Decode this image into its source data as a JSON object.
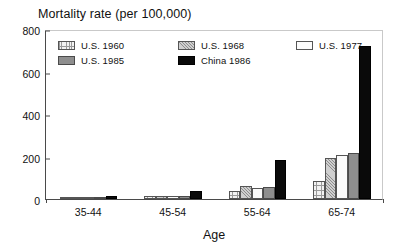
{
  "chart_data": {
    "type": "bar",
    "title": "Mortality rate (per 100,000)",
    "xlabel": "Age",
    "ylabel": "",
    "ylim": [
      0,
      800
    ],
    "yticks": [
      0,
      200,
      400,
      600,
      800
    ],
    "grid": false,
    "legend_position": "inside-top-left",
    "categories": [
      "35-44",
      "45-54",
      "55-64",
      "65-74"
    ],
    "series": [
      {
        "name": "U.S. 1960",
        "pattern": "cross",
        "values": [
          4,
          13,
          40,
          85
        ]
      },
      {
        "name": "U.S. 1968",
        "pattern": "hatch",
        "values": [
          5,
          16,
          62,
          195
        ]
      },
      {
        "name": "U.S. 1977",
        "pattern": "white",
        "values": [
          4,
          14,
          50,
          205
        ]
      },
      {
        "name": "U.S. 1985",
        "pattern": "gray",
        "values": [
          4,
          15,
          55,
          215
        ]
      },
      {
        "name": "China 1986",
        "pattern": "black",
        "values": [
          13,
          40,
          182,
          720
        ]
      }
    ]
  },
  "axis": {
    "ytick_labels": [
      "0",
      "200",
      "400",
      "600",
      "800"
    ],
    "xtick_labels": [
      "35-44",
      "45-54",
      "55-64",
      "65-74"
    ],
    "x_axis_title": "Age"
  },
  "legend": {
    "entries": [
      {
        "label": "U.S. 1960",
        "pattern": "cross"
      },
      {
        "label": "U.S. 1968",
        "pattern": "hatch"
      },
      {
        "label": "U.S. 1977",
        "pattern": "white"
      },
      {
        "label": "U.S. 1985",
        "pattern": "gray"
      },
      {
        "label": "China 1986",
        "pattern": "black"
      }
    ]
  },
  "colors": {
    "axis": "#4a4a4a",
    "text": "#111111",
    "background": "#ffffff",
    "series_gray": "#8e8e8e",
    "series_black": "#0a0a0a",
    "series_white": "#fbfbfb"
  }
}
